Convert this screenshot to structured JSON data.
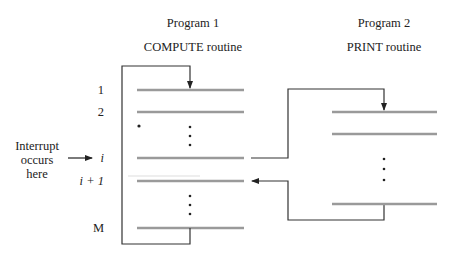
{
  "program1": {
    "title": "Program 1",
    "subtitle": "COMPUTE routine",
    "rows": [
      {
        "label": "1",
        "y": 90
      },
      {
        "label": "2",
        "y": 112
      },
      {
        "label": "i",
        "y": 158
      },
      {
        "label": "i + 1",
        "y": 181
      },
      {
        "label": "M",
        "y": 228
      }
    ]
  },
  "program2": {
    "title": "Program 2",
    "subtitle": "PRINT routine"
  },
  "interrupt_note": {
    "line1": "Interrupt",
    "line2": "occurs",
    "line3": "here"
  },
  "colors": {
    "instruction_line": "#999999",
    "flow_line": "#333333"
  }
}
